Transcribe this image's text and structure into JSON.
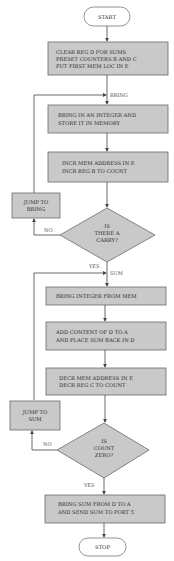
{
  "flowchart": {
    "start": "START",
    "stop": "STOP",
    "steps": [
      {
        "id": "init",
        "lines": [
          "CLEAR REG D FOR SUMS",
          "PRESET COUNTERS B AND C",
          "PUT FIRST MEM LOC IN E"
        ]
      },
      {
        "id": "bring",
        "lines": [
          "BRING IN AN INTEGER AND",
          "STORE IT IN MEMORY"
        ]
      },
      {
        "id": "incr",
        "lines": [
          "INCR MEM ADDRESS IN E",
          "INCR REG B TO COUNT"
        ]
      },
      {
        "id": "fetch",
        "lines": [
          "BRING INTEGER FROM MEM"
        ]
      },
      {
        "id": "add",
        "lines": [
          "ADD CONTENT OF D TO A",
          "AND PLACE SUM BACK IN D"
        ]
      },
      {
        "id": "decr",
        "lines": [
          "DECR MEM ADDRESS IN E",
          "DECR REG C TO COUNT"
        ]
      },
      {
        "id": "output",
        "lines": [
          "BRING SUM FROM D TO A",
          "AND SEND SUM TO PORT 5"
        ]
      }
    ],
    "decisions": [
      {
        "id": "carry",
        "lines": [
          "IS",
          "THERE A",
          "CARRY?"
        ],
        "yes": "YES",
        "no": "NO"
      },
      {
        "id": "count_zero",
        "lines": [
          "IS",
          "COUNT",
          "ZERO?"
        ],
        "yes": "YES",
        "no": "NO"
      }
    ],
    "jumps": [
      {
        "id": "jump_bring",
        "lines": [
          "JUMP TO",
          "BRING"
        ]
      },
      {
        "id": "jump_sum",
        "lines": [
          "JUMP TO",
          "SUM"
        ]
      }
    ],
    "labels": {
      "bring": "BRING",
      "sum": "SUM"
    }
  }
}
